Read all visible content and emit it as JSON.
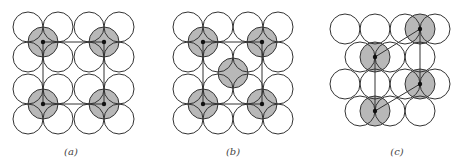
{
  "panels": [
    {
      "id": "a",
      "label": "(a)",
      "label_pos": [
        71,
        146
      ],
      "radius": 15,
      "white_circles": [
        [
          28,
          27
        ],
        [
          58,
          27
        ],
        [
          89,
          27
        ],
        [
          119,
          27
        ],
        [
          28,
          57
        ],
        [
          58,
          57
        ],
        [
          89,
          57
        ],
        [
          119,
          57
        ],
        [
          28,
          89
        ],
        [
          58,
          89
        ],
        [
          89,
          89
        ],
        [
          119,
          89
        ],
        [
          28,
          119
        ],
        [
          58,
          119
        ],
        [
          89,
          119
        ],
        [
          119,
          119
        ]
      ],
      "shaded_circles": [
        [
          43,
          42
        ],
        [
          104,
          42
        ],
        [
          43,
          104
        ],
        [
          104,
          104
        ]
      ],
      "dots": [
        [
          43,
          42
        ],
        [
          104,
          42
        ],
        [
          43,
          104
        ],
        [
          104,
          104
        ]
      ],
      "lines": [
        [
          43,
          42,
          104,
          42
        ],
        [
          104,
          42,
          104,
          104
        ],
        [
          104,
          104,
          43,
          104
        ],
        [
          43,
          104,
          43,
          42
        ]
      ]
    },
    {
      "id": "b",
      "label": "(b)",
      "label_pos": [
        233,
        146
      ],
      "radius": 15,
      "white_circles": [
        [
          188,
          27
        ],
        [
          218,
          27
        ],
        [
          248,
          27
        ],
        [
          278,
          27
        ],
        [
          188,
          57
        ],
        [
          218,
          57
        ],
        [
          248,
          57
        ],
        [
          278,
          57
        ],
        [
          188,
          89
        ],
        [
          218,
          89
        ],
        [
          248,
          89
        ],
        [
          278,
          89
        ],
        [
          188,
          119
        ],
        [
          218,
          119
        ],
        [
          248,
          119
        ],
        [
          278,
          119
        ]
      ],
      "shaded_circles": [
        [
          203,
          42
        ],
        [
          262,
          42
        ],
        [
          233,
          73
        ],
        [
          203,
          104
        ],
        [
          262,
          104
        ]
      ],
      "dots": [
        [
          203,
          42
        ],
        [
          262,
          42
        ],
        [
          203,
          104
        ],
        [
          262,
          104
        ]
      ],
      "lines": [
        [
          203,
          42,
          262,
          42
        ],
        [
          262,
          42,
          262,
          104
        ],
        [
          262,
          104,
          203,
          104
        ],
        [
          203,
          104,
          203,
          42
        ]
      ]
    },
    {
      "id": "c",
      "label": "(c)",
      "label_pos": [
        397,
        146
      ],
      "radius": 15,
      "white_circles": [
        [
          345,
          29
        ],
        [
          375,
          29
        ],
        [
          405,
          29
        ],
        [
          435,
          29
        ],
        [
          360,
          57
        ],
        [
          390,
          57
        ],
        [
          420,
          57
        ],
        [
          345,
          84
        ],
        [
          375,
          84
        ],
        [
          405,
          84
        ],
        [
          435,
          84
        ],
        [
          360,
          111
        ],
        [
          390,
          111
        ],
        [
          420,
          111
        ]
      ],
      "shaded_circles": [
        [
          420,
          29
        ],
        [
          375,
          57
        ],
        [
          420,
          84
        ],
        [
          375,
          111
        ]
      ],
      "dots": [
        [
          420,
          29
        ],
        [
          375,
          57
        ],
        [
          420,
          84
        ],
        [
          375,
          111
        ]
      ],
      "lines": [
        [
          420,
          29,
          375,
          57
        ],
        [
          420,
          29,
          420,
          84
        ],
        [
          375,
          57,
          375,
          111
        ],
        [
          420,
          84,
          375,
          111
        ]
      ]
    }
  ],
  "colors": {
    "stroke": "#333333",
    "shade": "#b8b8b8",
    "dot": "#111111",
    "background": "#ffffff"
  }
}
